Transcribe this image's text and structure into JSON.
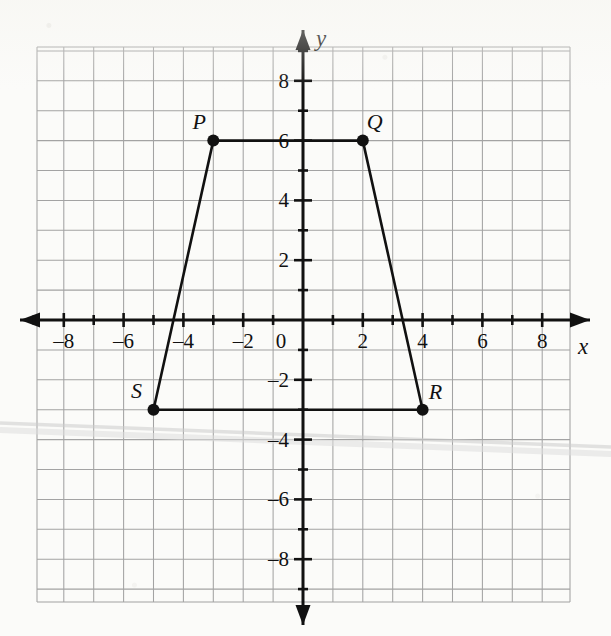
{
  "figure": {
    "axis_labels": {
      "x": "x",
      "y": "y",
      "origin": "0"
    },
    "colors": {
      "grid": "#9a9a9a",
      "axis": "#111111",
      "shape_stroke": "#111111",
      "point_fill": "#111111",
      "label_text": "#111111",
      "paper": "#fbfbf9",
      "scan_artifact": "#cfcfcf"
    }
  },
  "chart_data": {
    "type": "scatter",
    "xlabel": "x",
    "ylabel": "y",
    "xlim": [
      -9,
      9
    ],
    "ylim": [
      -9,
      9
    ],
    "grid": true,
    "legend": "none",
    "x_ticks": [
      -8,
      -6,
      -4,
      -2,
      2,
      4,
      6,
      8
    ],
    "x_tick_labels": [
      "–8",
      "–6",
      "–4",
      "–2",
      "2",
      "4",
      "6",
      "8"
    ],
    "y_ticks": [
      8,
      6,
      4,
      2,
      -2,
      -4,
      -6,
      -8
    ],
    "y_tick_labels": [
      "8",
      "6",
      "4",
      "2",
      "–2",
      "–4",
      "–6",
      "–8"
    ],
    "minor_tick_step": 1,
    "origin_label": "0",
    "points": [
      {
        "label": "P",
        "x": -3,
        "y": 6,
        "label_dx": -14,
        "label_dy": -12
      },
      {
        "label": "Q",
        "x": 2,
        "y": 6,
        "label_dx": 12,
        "label_dy": -12
      },
      {
        "label": "R",
        "x": 4,
        "y": -3,
        "label_dx": 13,
        "label_dy": -11
      },
      {
        "label": "S",
        "x": -5,
        "y": -3,
        "label_dx": -17,
        "label_dy": -12
      }
    ],
    "polygon": {
      "name": "PQRS",
      "closed": true,
      "vertex_order": [
        "P",
        "Q",
        "R",
        "S"
      ],
      "vertices": [
        [
          -3,
          6
        ],
        [
          2,
          6
        ],
        [
          4,
          -3
        ],
        [
          -5,
          -3
        ]
      ]
    },
    "edges": [
      {
        "from": "P",
        "to": "Q"
      },
      {
        "from": "Q",
        "to": "R"
      },
      {
        "from": "R",
        "to": "S"
      },
      {
        "from": "S",
        "to": "P"
      }
    ]
  },
  "geometry": {
    "origin_px": {
      "x": 303,
      "y": 320
    },
    "unit_px": 29.9,
    "grid_rect_px": {
      "left": 37,
      "top": 47,
      "right": 570,
      "bottom": 602
    },
    "x_axis_px": {
      "x1": 20,
      "x2": 590,
      "y": 320
    },
    "y_axis_px": {
      "y1": 30,
      "y2": 625,
      "x": 303
    },
    "point_radius_px": 6,
    "tick_len_major_px": 7,
    "tick_len_minor_px": 5
  }
}
